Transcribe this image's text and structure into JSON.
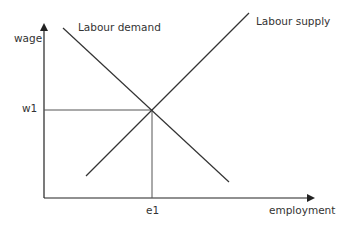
{
  "diagram": {
    "type": "supply-demand",
    "axes": {
      "y_label": "wage",
      "x_label": "employment"
    },
    "curves": [
      {
        "name": "Labour demand",
        "label": "Labour demand",
        "from": [
          63,
          28
        ],
        "to": [
          229,
          182
        ]
      },
      {
        "name": "Labour supply",
        "label": "Labour supply",
        "from": [
          86,
          176
        ],
        "to": [
          249,
          13
        ]
      }
    ],
    "equilibrium": {
      "wage_label": "w1",
      "employment_label": "e1",
      "point": [
        152,
        110
      ]
    },
    "colors": {
      "axis": "#222222",
      "curve": "#333333",
      "guide": "#555555",
      "text": "#333333"
    }
  }
}
